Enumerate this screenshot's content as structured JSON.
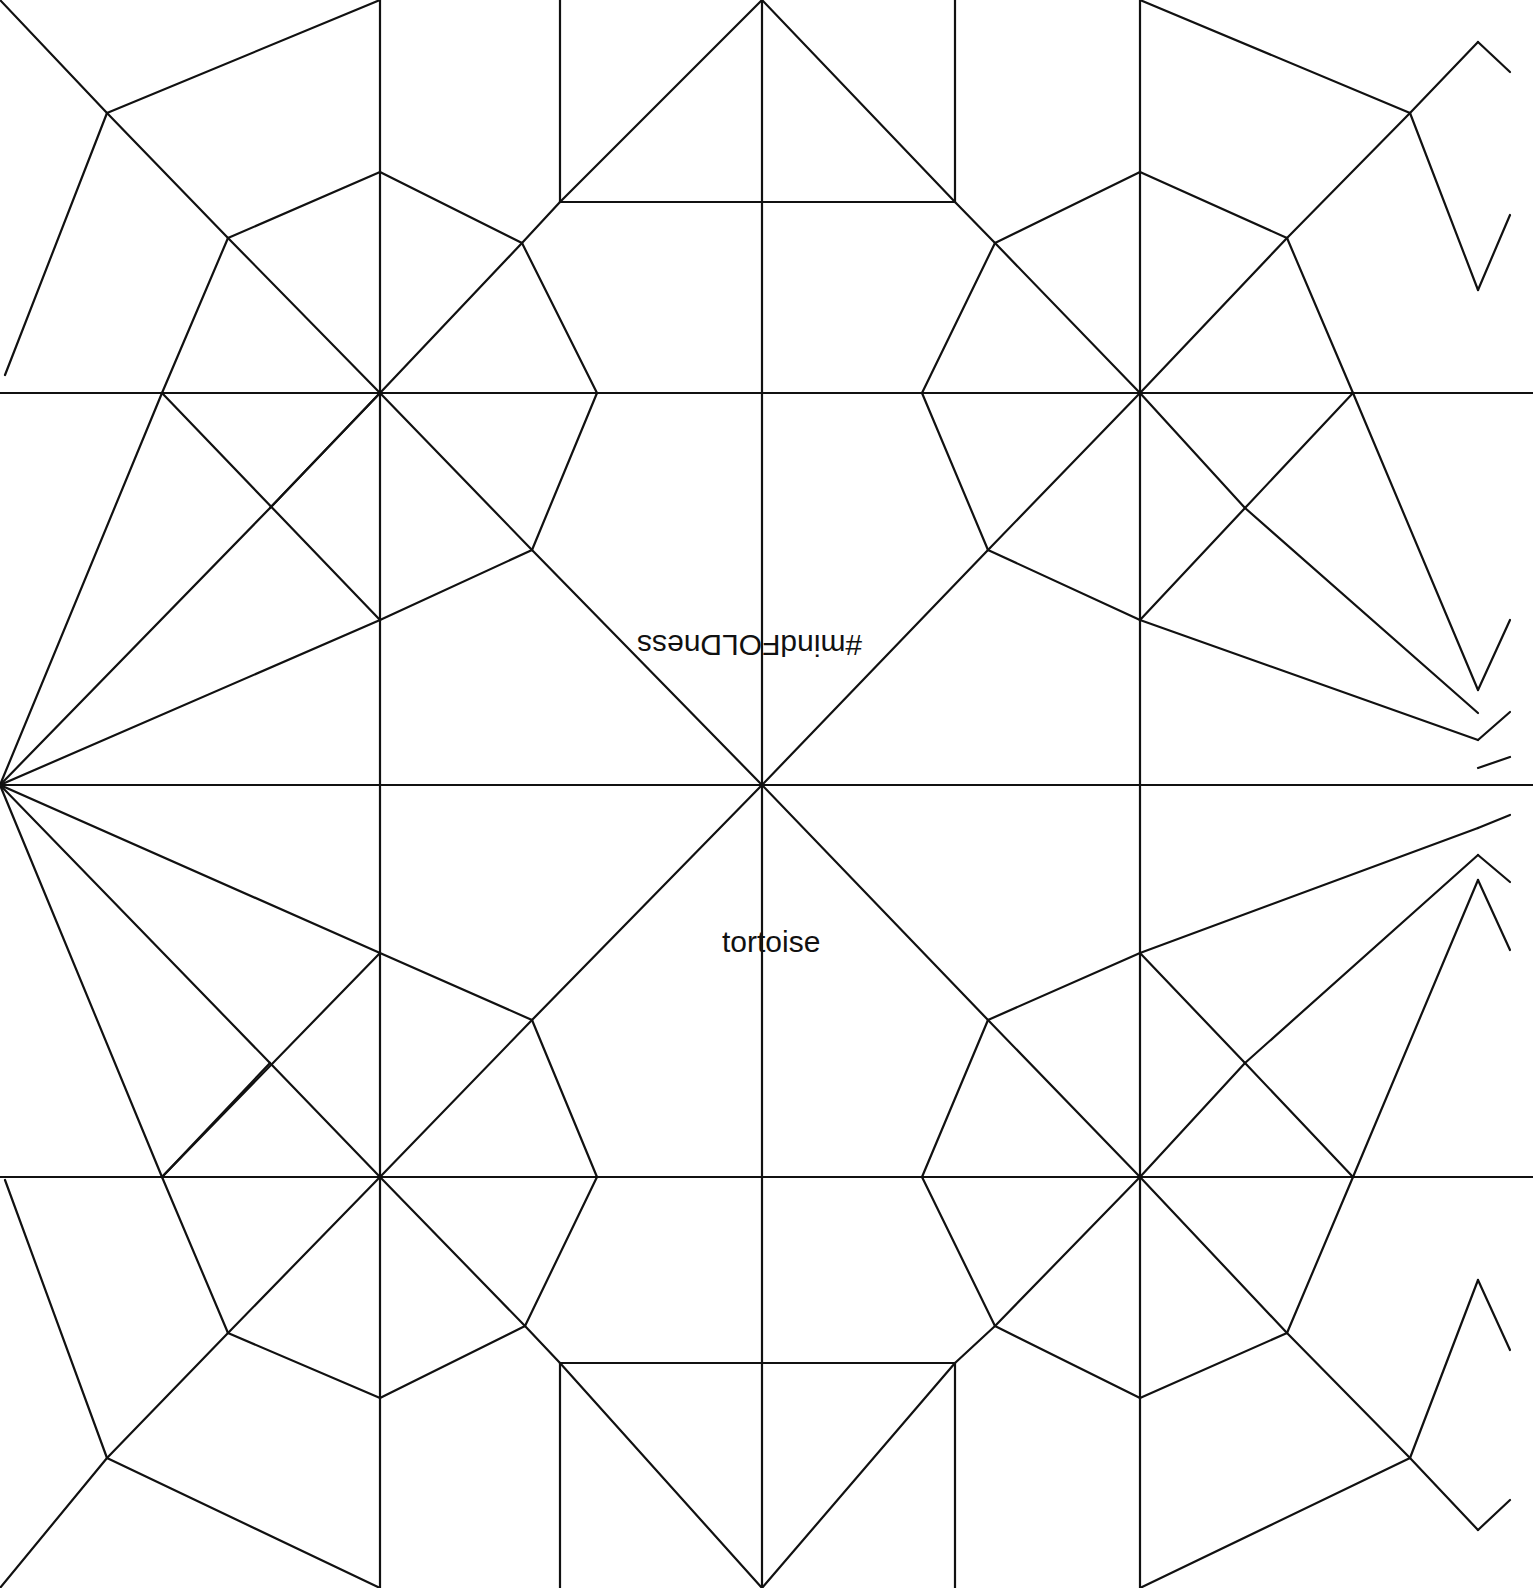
{
  "diagram": {
    "type": "origami-crease-pattern",
    "subject": "tortoise",
    "background": "#ffffff",
    "line_color": "#111111"
  },
  "labels": {
    "hashtag": "#mindFOLDness",
    "title": "tortoise"
  },
  "segments": [
    [
      380,
      0,
      380,
      1588
    ],
    [
      762,
      0,
      762,
      1588
    ],
    [
      1140,
      0,
      1140,
      1588
    ],
    [
      560,
      0,
      560,
      202
    ],
    [
      955,
      0,
      955,
      202
    ],
    [
      560,
      1363,
      560,
      1588
    ],
    [
      955,
      1363,
      955,
      1588
    ],
    [
      0,
      393,
      1533,
      393
    ],
    [
      0,
      785,
      1533,
      785
    ],
    [
      0,
      1177,
      1533,
      1177
    ],
    [
      560,
      202,
      955,
      202
    ],
    [
      560,
      1363,
      955,
      1363
    ],
    [
      560,
      202,
      762,
      0
    ],
    [
      762,
      0,
      955,
      202
    ],
    [
      560,
      1363,
      762,
      1588
    ],
    [
      762,
      1588,
      955,
      1363
    ],
    [
      0,
      0,
      107,
      113
    ],
    [
      107,
      113,
      228,
      238
    ],
    [
      228,
      238,
      380,
      393
    ],
    [
      380,
      393,
      532,
      550
    ],
    [
      532,
      550,
      762,
      785
    ],
    [
      762,
      785,
      988,
      1020
    ],
    [
      988,
      1020,
      1140,
      1177
    ],
    [
      1140,
      1177,
      1287,
      1333
    ],
    [
      1287,
      1333,
      1410,
      1458
    ],
    [
      1410,
      1458,
      1478,
      1530
    ],
    [
      1478,
      1530,
      1510,
      1500
    ],
    [
      107,
      113,
      380,
      0
    ],
    [
      107,
      113,
      5,
      375
    ],
    [
      228,
      238,
      380,
      172
    ],
    [
      228,
      238,
      162,
      393
    ],
    [
      380,
      172,
      522,
      243
    ],
    [
      522,
      243,
      597,
      393
    ],
    [
      522,
      243,
      560,
      202
    ],
    [
      380,
      393,
      522,
      243
    ],
    [
      597,
      393,
      532,
      550
    ],
    [
      532,
      550,
      380,
      620
    ],
    [
      162,
      393,
      380,
      620
    ],
    [
      380,
      393,
      270,
      508
    ],
    [
      0,
      785,
      162,
      393
    ],
    [
      0,
      785,
      270,
      508
    ],
    [
      270,
      508,
      380,
      393
    ],
    [
      0,
      785,
      380,
      620
    ],
    [
      0,
      785,
      162,
      1177
    ],
    [
      0,
      785,
      270,
      1063
    ],
    [
      270,
      1063,
      380,
      1177
    ],
    [
      0,
      785,
      380,
      953
    ],
    [
      162,
      1177,
      380,
      953
    ],
    [
      380,
      953,
      532,
      1020
    ],
    [
      532,
      1020,
      597,
      1177
    ],
    [
      532,
      1020,
      762,
      785
    ],
    [
      380,
      1177,
      532,
      1020
    ],
    [
      380,
      1177,
      525,
      1326
    ],
    [
      525,
      1326,
      560,
      1363
    ],
    [
      597,
      1177,
      525,
      1326
    ],
    [
      525,
      1326,
      380,
      1398
    ],
    [
      162,
      1177,
      228,
      1333
    ],
    [
      228,
      1333,
      380,
      1398
    ],
    [
      380,
      1177,
      228,
      1333
    ],
    [
      228,
      1333,
      107,
      1458
    ],
    [
      107,
      1458,
      380,
      1588
    ],
    [
      107,
      1458,
      0,
      1588
    ],
    [
      5,
      1180,
      107,
      1458
    ],
    [
      162,
      1177,
      270,
      1063
    ],
    [
      762,
      785,
      988,
      550
    ],
    [
      988,
      550,
      1140,
      393
    ],
    [
      1140,
      393,
      1287,
      238
    ],
    [
      1287,
      238,
      1410,
      113
    ],
    [
      1410,
      113,
      1478,
      42
    ],
    [
      1478,
      42,
      1510,
      72
    ],
    [
      955,
      202,
      995,
      243
    ],
    [
      995,
      243,
      1140,
      393
    ],
    [
      995,
      243,
      1140,
      172
    ],
    [
      1140,
      172,
      1287,
      238
    ],
    [
      995,
      243,
      922,
      393
    ],
    [
      922,
      393,
      988,
      550
    ],
    [
      988,
      550,
      1140,
      620
    ],
    [
      1140,
      620,
      1478,
      740
    ],
    [
      1478,
      740,
      1510,
      712
    ],
    [
      1140,
      393,
      1245,
      508
    ],
    [
      1245,
      508,
      1478,
      713
    ],
    [
      1140,
      620,
      1245,
      508
    ],
    [
      1245,
      508,
      1353,
      393
    ],
    [
      1287,
      238,
      1353,
      393
    ],
    [
      1353,
      393,
      1478,
      690
    ],
    [
      1478,
      690,
      1510,
      620
    ],
    [
      1140,
      0,
      1410,
      113
    ],
    [
      1410,
      113,
      1478,
      290
    ],
    [
      1478,
      290,
      1510,
      215
    ],
    [
      1478,
      768,
      1510,
      757
    ],
    [
      988,
      1020,
      1140,
      953
    ],
    [
      1140,
      953,
      1478,
      828
    ],
    [
      1478,
      828,
      1510,
      815
    ],
    [
      1140,
      953,
      1245,
      1063
    ],
    [
      1245,
      1063,
      1478,
      855
    ],
    [
      1478,
      855,
      1510,
      882
    ],
    [
      1140,
      1177,
      1245,
      1063
    ],
    [
      1245,
      1063,
      1353,
      1177
    ],
    [
      1353,
      1177,
      1478,
      880
    ],
    [
      1478,
      880,
      1510,
      950
    ],
    [
      922,
      1177,
      988,
      1020
    ],
    [
      1140,
      1177,
      995,
      1326
    ],
    [
      922,
      1177,
      995,
      1326
    ],
    [
      995,
      1326,
      955,
      1363
    ],
    [
      995,
      1326,
      1140,
      1398
    ],
    [
      1140,
      1398,
      1287,
      1333
    ],
    [
      1287,
      1333,
      1353,
      1177
    ],
    [
      1140,
      1588,
      1410,
      1458
    ],
    [
      1410,
      1458,
      1478,
      1280
    ],
    [
      1478,
      1280,
      1510,
      1350
    ]
  ]
}
